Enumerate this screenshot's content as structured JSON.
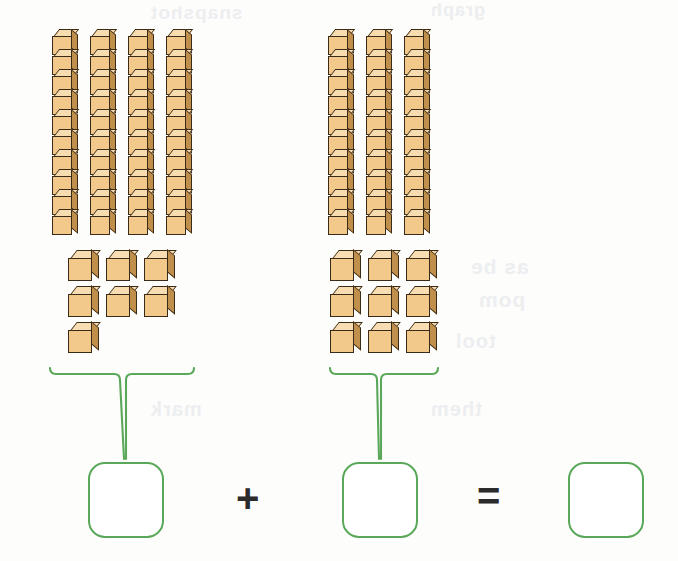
{
  "worksheet": {
    "type": "base-ten-blocks-addition",
    "title": "Base ten blocks addition",
    "background_color": "#fdfdfc",
    "block_colors": {
      "front": "#f2c98a",
      "top": "#f7dcaf",
      "right": "#c08f4c",
      "outline": "#3a2a18"
    },
    "accent_color": "#5aa85a",
    "operator_color": "#2b2b2b"
  },
  "groups": [
    {
      "name": "addend-1",
      "tens_rods": 4,
      "cubes_per_rod": 10,
      "ones_cubes": 7,
      "ones_rows": [
        3,
        3,
        1
      ],
      "value": 47,
      "brace_label": ""
    },
    {
      "name": "addend-2",
      "tens_rods": 3,
      "cubes_per_rod": 10,
      "ones_cubes": 9,
      "ones_rows": [
        3,
        3,
        3
      ],
      "value": 39,
      "brace_label": ""
    }
  ],
  "equation": {
    "addend_1_value": "",
    "addend_1_placeholder": "",
    "plus_symbol": "+",
    "addend_2_value": "",
    "addend_2_placeholder": "",
    "equals_symbol": "=",
    "sum_value": "",
    "sum_placeholder": ""
  },
  "bleed_through": {
    "line_1": "snapshot",
    "line_2": "graph",
    "line_3": "as be",
    "line_4": "pom",
    "line_5": "tool",
    "line_6": "mark",
    "line_7": "them"
  },
  "chart_data": {
    "type": "bar",
    "categories": [
      "Addend 1",
      "Addend 2",
      "Sum"
    ],
    "values": [
      47,
      39,
      86
    ],
    "xlabel": "",
    "ylabel": "",
    "ylim": [
      0,
      100
    ]
  }
}
